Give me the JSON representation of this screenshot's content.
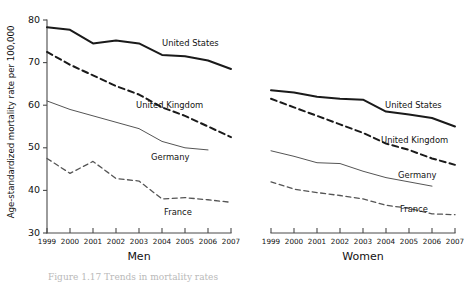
{
  "figure": {
    "ylabel": "Age-standardized mortality rate per 100,000",
    "caption": "Figure 1.17 Trends in mortality rates"
  },
  "axes": {
    "y_ticks": [
      "30",
      "40",
      "50",
      "60",
      "70",
      "80"
    ],
    "y_min": 30,
    "y_max": 80,
    "x_ticks": [
      "1999",
      "2000",
      "2001",
      "2002",
      "2003",
      "2004",
      "2005",
      "2006",
      "2007"
    ]
  },
  "panels": [
    {
      "id": "men",
      "label": "Men"
    },
    {
      "id": "women",
      "label": "Women"
    }
  ],
  "series_labels": {
    "us": "United States",
    "uk": "United Kingdom",
    "de": "Germany",
    "fr": "France"
  },
  "chart_data": {
    "type": "line",
    "title": "",
    "xlabel": "",
    "ylabel": "Age-standardized mortality rate per 100,000",
    "ylim": [
      30,
      80
    ],
    "grid": false,
    "legend": "inline-labels",
    "x": [
      1999,
      2000,
      2001,
      2002,
      2003,
      2004,
      2005,
      2006,
      2007
    ],
    "panels": [
      {
        "name": "Men",
        "series": [
          {
            "name": "United States",
            "style": "solid-bold",
            "color": "#1a1a1a",
            "x": [
              1999,
              2000,
              2001,
              2002,
              2003,
              2004,
              2005,
              2006,
              2007
            ],
            "values": [
              78.3,
              77.7,
              74.5,
              75.2,
              74.5,
              71.8,
              71.5,
              70.5,
              68.5
            ]
          },
          {
            "name": "United Kingdom",
            "style": "dashed-bold",
            "color": "#1a1a1a",
            "x": [
              1999,
              2000,
              2001,
              2002,
              2003,
              2004,
              2005,
              2006,
              2007
            ],
            "values": [
              72.5,
              69.5,
              67.0,
              64.5,
              62.5,
              59.5,
              57.5,
              55.0,
              52.5
            ]
          },
          {
            "name": "Germany",
            "style": "solid-thin",
            "color": "#555555",
            "x": [
              1999,
              2000,
              2001,
              2002,
              2003,
              2004,
              2005,
              2006
            ],
            "values": [
              61.0,
              59.0,
              57.5,
              56.0,
              54.5,
              51.5,
              50.0,
              49.5
            ]
          },
          {
            "name": "France",
            "style": "dashed-thin",
            "color": "#555555",
            "x": [
              1999,
              2000,
              2001,
              2002,
              2003,
              2004,
              2005,
              2006,
              2007
            ],
            "values": [
              47.5,
              44.0,
              46.8,
              42.8,
              42.2,
              38.0,
              38.3,
              37.8,
              37.2
            ]
          }
        ]
      },
      {
        "name": "Women",
        "series": [
          {
            "name": "United States",
            "style": "solid-bold",
            "color": "#1a1a1a",
            "x": [
              1999,
              2000,
              2001,
              2002,
              2003,
              2004,
              2005,
              2006,
              2007
            ],
            "values": [
              63.5,
              63.0,
              62.0,
              61.5,
              61.3,
              58.5,
              57.8,
              57.0,
              55.0
            ]
          },
          {
            "name": "United Kingdom",
            "style": "dashed-bold",
            "color": "#1a1a1a",
            "x": [
              1999,
              2000,
              2001,
              2002,
              2003,
              2004,
              2005,
              2006,
              2007
            ],
            "values": [
              61.5,
              59.5,
              57.5,
              55.5,
              53.5,
              51.0,
              49.5,
              47.5,
              46.0
            ]
          },
          {
            "name": "Germany",
            "style": "solid-thin",
            "color": "#555555",
            "x": [
              1999,
              2000,
              2001,
              2002,
              2003,
              2004,
              2005,
              2006
            ],
            "values": [
              49.3,
              48.0,
              46.5,
              46.3,
              44.5,
              43.0,
              42.0,
              41.0
            ]
          },
          {
            "name": "France",
            "style": "dashed-thin",
            "color": "#555555",
            "x": [
              1999,
              2000,
              2001,
              2002,
              2003,
              2004,
              2005,
              2006,
              2007
            ],
            "values": [
              42.0,
              40.3,
              39.5,
              38.8,
              38.0,
              36.5,
              35.8,
              34.5,
              34.3
            ]
          }
        ]
      }
    ]
  }
}
